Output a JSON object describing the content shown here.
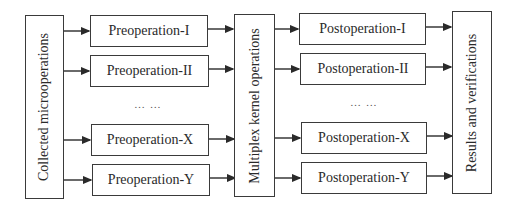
{
  "diagram": {
    "source": {
      "label": "Collected microoperations"
    },
    "preoperations": [
      {
        "label": "Preoperation-I"
      },
      {
        "label": "Preoperation-II"
      },
      {
        "label": "Preoperation-X"
      },
      {
        "label": "Preoperation-Y"
      }
    ],
    "pre_ellipsis": "… …",
    "kernel": {
      "label": "Multiplex kernel operations"
    },
    "postoperations": [
      {
        "label": "Postoperation-I"
      },
      {
        "label": "Postoperation-II"
      },
      {
        "label": "Postoperation-X"
      },
      {
        "label": "Postoperation-Y"
      }
    ],
    "post_ellipsis": "… …",
    "sink": {
      "label": "Results and verifications"
    },
    "colors": {
      "stroke": "#3a3a3a",
      "text": "#2a2a2a",
      "background": "#ffffff"
    }
  }
}
